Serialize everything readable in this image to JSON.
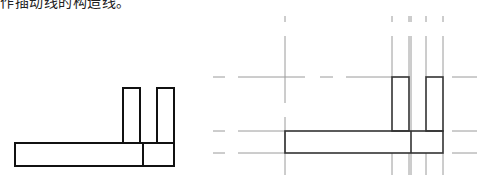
{
  "caption": "作插动线的构造线。",
  "figures": [
    {
      "name": "original-shape",
      "description": "L-shaped outline with two vertical posts"
    },
    {
      "name": "construction-lines-shape",
      "description": "Same outline with construction lines (xlines) through each edge"
    }
  ],
  "colors": {
    "outline": "#111111",
    "construction": "#9a9a9a"
  }
}
